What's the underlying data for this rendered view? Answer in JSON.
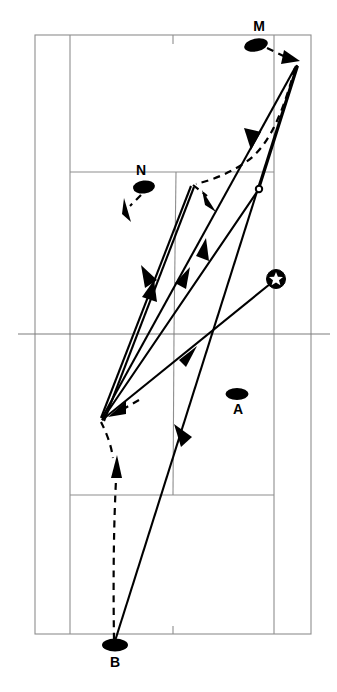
{
  "diagram": {
    "type": "tennis-court-tactical-diagram",
    "title": "",
    "canvas": {
      "width": 337,
      "height": 692
    },
    "court": {
      "outer_left": 35,
      "outer_right": 311,
      "outer_top": 35,
      "outer_bottom": 634,
      "singles_left": 70,
      "singles_right": 274,
      "net_y": 334,
      "net_left": 18,
      "net_right": 330,
      "service_line_far_y": 172,
      "service_line_near_y": 495,
      "center_service_x_far": 176,
      "center_service_x_near": 173,
      "center_mark_far_x": 173,
      "center_mark_near_x": 173,
      "line_color": "#8e8e8e",
      "background_color": "#ffffff"
    },
    "players": [
      {
        "id": "M",
        "label": "M",
        "x": 256,
        "y": 45,
        "label_x": 259,
        "label_y": 31,
        "rx": 12,
        "ry": 6.5,
        "rotation": -12
      },
      {
        "id": "N",
        "label": "N",
        "x": 144,
        "y": 187,
        "label_x": 141,
        "label_y": 175,
        "rx": 11,
        "ry": 6.5,
        "rotation": -6
      },
      {
        "id": "A",
        "label": "A",
        "x": 237,
        "y": 394,
        "label_x": 238,
        "label_y": 414,
        "rx": 11.5,
        "ry": 6,
        "rotation": 0
      },
      {
        "id": "B",
        "label": "B",
        "x": 115,
        "y": 645,
        "label_x": 115,
        "label_y": 666,
        "rx": 13,
        "ry": 6.5,
        "rotation": 0
      }
    ],
    "markers": [
      {
        "id": "bounce-1",
        "kind": "open-circle",
        "x": 259,
        "y": 189,
        "r": 3.2
      },
      {
        "id": "star-1",
        "kind": "star-in-circle",
        "x": 276,
        "y": 279,
        "r": 9.5
      }
    ],
    "shot_paths": [
      {
        "id": "shot-b-to-topright",
        "from": "B",
        "to": "top-right-apex",
        "points": "115,642 297,64"
      },
      {
        "id": "shot-topright-to-leftapex",
        "from": "top-right-apex",
        "to": "left-apex",
        "points": "297,64 101,419"
      },
      {
        "id": "shot-leftapex-to-upper-apex",
        "from": "left-apex",
        "to": "upper-apex",
        "points": "101,419 193,186"
      },
      {
        "id": "shot-upperapex-to-leftapex",
        "from": "upper-apex",
        "to": "left-apex",
        "points": "193,186 101,419"
      },
      {
        "id": "shot-leftapex-to-star",
        "from": "left-apex",
        "to": "star-1",
        "points": "101,419 276,279"
      },
      {
        "id": "shot-bounce-to-topright",
        "from": "bounce-1",
        "to": "top-right-apex",
        "points": "259,189 297,64"
      },
      {
        "id": "shot-star-line-down",
        "from": "star-1",
        "to": "lower-right",
        "points": "276,279 259,189"
      }
    ],
    "move_paths": [
      {
        "id": "move-m-to-apex",
        "from": "M",
        "to": "top-right-apex",
        "desc": "M steps to hit"
      },
      {
        "id": "move-apex-to-midcourt",
        "from": "top-right-apex",
        "to": "upper-apex",
        "desc": "recovery down the line"
      },
      {
        "id": "move-n-forward",
        "from": "N",
        "desc": "N moves diagonally"
      },
      {
        "id": "move-b-forward",
        "from": "B",
        "desc": "B advances to net"
      },
      {
        "id": "move-leftapex-inward",
        "from": "left-apex",
        "desc": "short diagonal recovery"
      }
    ],
    "legend": {
      "solid": "ball trajectory",
      "dashed": "player movement",
      "open_circle": "ball bounce",
      "star": "winning shot"
    }
  }
}
